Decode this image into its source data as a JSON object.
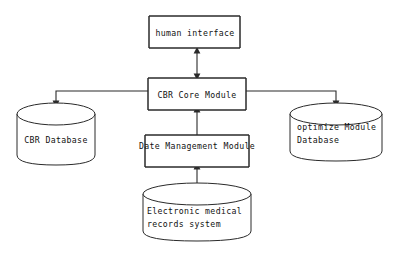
{
  "diagram": {
    "type": "block-diagram",
    "background_color": "#ffffff",
    "stroke_color": "#2a2a2a",
    "text_color": "#111111",
    "nodes": [
      {
        "id": "human_interface",
        "shape": "rounded-bracket-box",
        "label": "human interface",
        "lines": [
          "human interface"
        ]
      },
      {
        "id": "cbr_core_module",
        "shape": "rounded-bracket-box",
        "label": "CBR Core Module",
        "lines": [
          "CBR Core Module"
        ]
      },
      {
        "id": "date_management_module",
        "shape": "rounded-bracket-box",
        "label": "Date Management Module",
        "lines": [
          "Date Management Module"
        ]
      },
      {
        "id": "cbr_database",
        "shape": "cylinder",
        "label": "CBR Database",
        "lines": [
          "CBR Database"
        ]
      },
      {
        "id": "optimize_module_database",
        "shape": "cylinder",
        "label": "optimize Module Database",
        "lines": [
          "optimize Module",
          "Database"
        ]
      },
      {
        "id": "electronic_medical_records_system",
        "shape": "cylinder",
        "label": "Electronic medical records system",
        "lines": [
          "Electronic medical",
          "records system"
        ]
      }
    ],
    "edges": [
      {
        "id": "edge-core-human",
        "from": "cbr_core_module",
        "to": "human_interface",
        "direction": "bidirectional",
        "label": ""
      },
      {
        "id": "edge-core-cbrdb",
        "from": "cbr_core_module",
        "to": "cbr_database",
        "direction": "forward",
        "label": ""
      },
      {
        "id": "edge-core-optdb",
        "from": "cbr_core_module",
        "to": "optimize_module_database",
        "direction": "forward",
        "label": ""
      },
      {
        "id": "edge-data-core",
        "from": "date_management_module",
        "to": "cbr_core_module",
        "direction": "forward",
        "label": ""
      },
      {
        "id": "edge-emr-data",
        "from": "electronic_medical_records_system",
        "to": "date_management_module",
        "direction": "forward",
        "label": ""
      }
    ]
  }
}
